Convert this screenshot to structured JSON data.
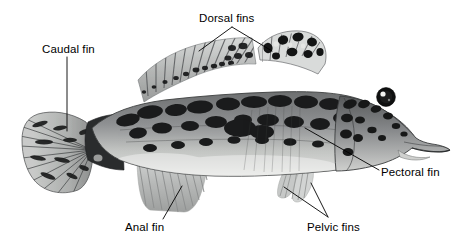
{
  "figure": {
    "background_color": "#ffffff",
    "line_color": "#000000",
    "body_gray": "#8f9193",
    "dark_blotch": "#1c1c1c",
    "belly_light": "#d8d9d6",
    "fin_gray": "#b9bbbb"
  },
  "labels": {
    "caudal": "Caudal fin",
    "dorsal": "Dorsal fins",
    "pectoral": "Pectoral fin",
    "anal": "Anal fin",
    "pelvic": "Pelvic fins"
  },
  "leaders": {
    "caudal": "vertical line from label down to tail fin",
    "dorsal": "branching V to first and second dorsal fins",
    "pectoral": "diagonal line up-left to pectoral fin",
    "anal": "diagonal line up-right to anal fin",
    "pelvic": "branching V up-left to two pelvic fins"
  }
}
